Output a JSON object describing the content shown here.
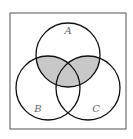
{
  "diagram": {
    "type": "venn",
    "sets": [
      {
        "name": "A",
        "cx": 68,
        "cy": 55,
        "r": 32,
        "label_x": 68,
        "label_y": 34
      },
      {
        "name": "B",
        "cx": 48,
        "cy": 88,
        "r": 32,
        "label_x": 38,
        "label_y": 112
      },
      {
        "name": "C",
        "cx": 88,
        "cy": 88,
        "r": 32,
        "label_x": 96,
        "label_y": 112
      }
    ],
    "shaded_region": "A ∩ (B ∪ C)",
    "colors": {
      "stroke": "#111111",
      "shade": "#c8c8c8",
      "frame": "#555555",
      "label": "#666666"
    }
  }
}
